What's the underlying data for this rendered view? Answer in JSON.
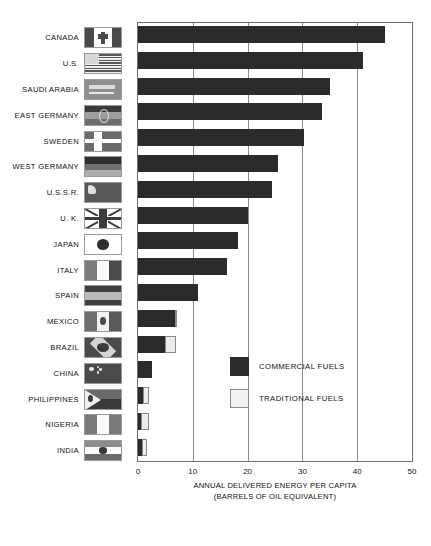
{
  "chart_data": {
    "type": "bar",
    "orientation": "horizontal",
    "title": "",
    "xlabel": "ANNUAL DELIVERED ENERGY PER CAPITA",
    "xlabel_line2": "(BARRELS OF OIL EQUIVALENT)",
    "ylabel": "",
    "xlim": [
      0,
      50
    ],
    "xticks": [
      0,
      10,
      20,
      30,
      40,
      50
    ],
    "xtick_labels": [
      "0",
      "10",
      "20",
      "30",
      "40",
      "50"
    ],
    "grid": "vertical",
    "legend_position": "center-right",
    "stacked": true,
    "categories": [
      "CANADA",
      "U.S.",
      "SAUDI ARABIA",
      "EAST GERMANY",
      "SWEDEN",
      "WEST GERMANY",
      "U.S.S.R.",
      "U. K.",
      "JAPAN",
      "ITALY",
      "SPAIN",
      "MEXICO",
      "BRAZIL",
      "CHINA",
      "PHILIPPINES",
      "NIGERIA",
      "INDIA"
    ],
    "series": [
      {
        "name": "COMMERCIAL FUELS",
        "color": "#2b2b2b",
        "values": [
          45.0,
          41.0,
          35.0,
          33.5,
          30.3,
          25.5,
          24.4,
          20.0,
          18.3,
          16.2,
          11.0,
          6.8,
          5.0,
          2.5,
          1.0,
          0.6,
          0.8
        ]
      },
      {
        "name": "TRADITIONAL FUELS",
        "color": "#ececec",
        "values": [
          0,
          0,
          0,
          0,
          0,
          0,
          0,
          0,
          0,
          0,
          0,
          0.4,
          2.0,
          0,
          1.0,
          1.4,
          0.9
        ]
      }
    ],
    "totals": [
      45.0,
      41.0,
      35.0,
      33.5,
      30.3,
      25.5,
      24.4,
      20.0,
      18.3,
      16.2,
      11.0,
      7.2,
      7.0,
      2.5,
      2.0,
      2.0,
      1.7
    ]
  },
  "legend": {
    "items": [
      {
        "label": "COMMERCIAL FUELS",
        "swatch": "commercial"
      },
      {
        "label": "TRADITIONAL FUELS",
        "swatch": "traditional"
      }
    ]
  },
  "flags": {
    "CANADA": "flag-canada-icon",
    "U.S.": "flag-united-states-icon",
    "SAUDI ARABIA": "flag-saudi-arabia-icon",
    "EAST GERMANY": "flag-east-germany-icon",
    "SWEDEN": "flag-sweden-icon",
    "WEST GERMANY": "flag-west-germany-icon",
    "U.S.S.R.": "flag-ussr-icon",
    "U. K.": "flag-united-kingdom-icon",
    "JAPAN": "flag-japan-icon",
    "ITALY": "flag-italy-icon",
    "SPAIN": "flag-spain-icon",
    "MEXICO": "flag-mexico-icon",
    "BRAZIL": "flag-brazil-icon",
    "CHINA": "flag-china-icon",
    "PHILIPPINES": "flag-philippines-icon",
    "NIGERIA": "flag-nigeria-icon",
    "INDIA": "flag-india-icon"
  },
  "colors": {
    "commercial": "#2b2b2b",
    "traditional": "#ececec",
    "grid": "#8a8a8a",
    "frame": "#6f6f6f",
    "text": "#111111"
  }
}
